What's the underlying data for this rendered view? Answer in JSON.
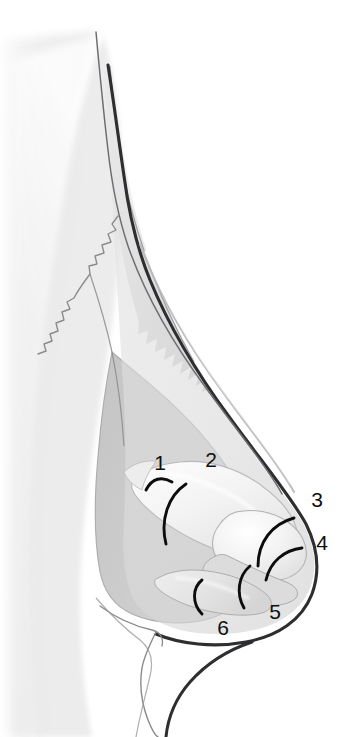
{
  "figure": {
    "background_color": "#ffffff",
    "style": "grayscale medical illustration, airbrush shading, line art"
  },
  "palette": {
    "background": "#ffffff",
    "soft_tissue_shadow": "#ececed",
    "face_fill": "#e6e6e7",
    "nasal_skin_fill": "#e2e2e3",
    "deep_tissue_gray": "#c9c9ca",
    "mid_gray": "#d2d2d3",
    "cartilage_light": "#f2f2f2",
    "cartilage_highlight": "#fafafa",
    "outline_soft": "#8e8e90",
    "outline_mid": "#76767a",
    "outline_dark": "#3d3d40",
    "dorsum_stroke": "#2e2e31",
    "marker_black": "#0d0d0d",
    "label_color": "#101010"
  },
  "labels": [
    {
      "id": "label-1",
      "text": "1",
      "x": 160,
      "y": 470,
      "anatomy": "nasal-bone-upper-lateral-cartilage-junction"
    },
    {
      "id": "label-2",
      "text": "2",
      "x": 211,
      "y": 467,
      "anatomy": "upper-lateral-cartilage"
    },
    {
      "id": "label-3",
      "text": "3",
      "x": 317,
      "y": 507,
      "anatomy": "lateral-crus-of-lower-lateral-cartilage"
    },
    {
      "id": "label-4",
      "text": "4",
      "x": 322,
      "y": 550,
      "anatomy": "dome-of-lower-lateral-cartilage"
    },
    {
      "id": "label-5",
      "text": "5",
      "x": 275,
      "y": 619,
      "anatomy": "medial-crus-lateral-crus-junction"
    },
    {
      "id": "label-6",
      "text": "6",
      "x": 223,
      "y": 635,
      "anatomy": "medial-crus-footplate"
    }
  ],
  "markers": [
    {
      "id": "marker-arc-1",
      "for_label": "1",
      "description": "black arc over nasal bone cartilage junction"
    },
    {
      "id": "marker-arc-2",
      "for_label": "2",
      "description": "black arc over upper lateral cartilage"
    },
    {
      "id": "marker-arc-3",
      "for_label": "3",
      "description": "black arc over lateral crus upper border"
    },
    {
      "id": "marker-arc-4",
      "for_label": "4",
      "description": "black arc over cartilage dome"
    },
    {
      "id": "marker-arc-5",
      "for_label": "5",
      "description": "black arc over crural junction"
    },
    {
      "id": "marker-arc-6",
      "for_label": "6",
      "description": "black arc over medial crus"
    }
  ],
  "structures": [
    {
      "id": "face-soft-tissue",
      "name": "facial soft tissue silhouette"
    },
    {
      "id": "nasal-dorsum-line",
      "name": "nasal dorsum skin contour"
    },
    {
      "id": "nasofrontal-angle",
      "name": "nasofrontal angle"
    },
    {
      "id": "nasomaxillary-suture",
      "name": "zigzag nasomaxillary suture line"
    },
    {
      "id": "nasal-bone",
      "name": "nasal bone with serrated caudal margin"
    },
    {
      "id": "upper-lateral-cartilage",
      "name": "upper lateral cartilage"
    },
    {
      "id": "lower-lateral-cartilage",
      "name": "lower lateral cartilage (alar)"
    },
    {
      "id": "medial-crus",
      "name": "medial crus of lower lateral cartilage"
    },
    {
      "id": "pyriform-aperture-region",
      "name": "pyriform aperture soft tissue"
    },
    {
      "id": "upper-lip",
      "name": "upper lip contour"
    },
    {
      "id": "columella",
      "name": "columella"
    }
  ]
}
